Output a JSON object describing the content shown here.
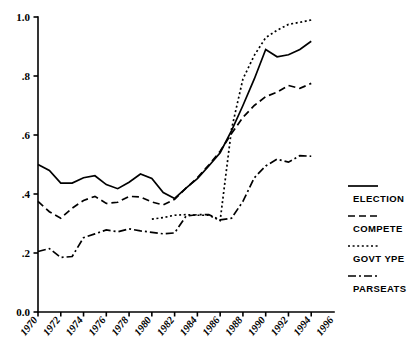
{
  "chart_data": {
    "type": "line",
    "title": "",
    "subtitle": "",
    "xlabel": "",
    "ylabel": "",
    "xlim": [
      1970,
      1996
    ],
    "ylim": [
      0.0,
      1.0
    ],
    "grid": false,
    "legend_position": "right",
    "x": [
      1970,
      1971,
      1972,
      1973,
      1974,
      1975,
      1976,
      1977,
      1978,
      1979,
      1980,
      1981,
      1982,
      1983,
      1984,
      1985,
      1986,
      1987,
      1988,
      1989,
      1990,
      1991,
      1992,
      1993,
      1994
    ],
    "x_tick_labels": [
      "1970",
      "1972",
      "1974",
      "1976",
      "1978",
      "1980",
      "1982",
      "1984",
      "1986",
      "1988",
      "1990",
      "1992",
      "1994",
      "1996"
    ],
    "y_tick_labels": [
      "0.0",
      ".2",
      ".4",
      ".6",
      ".8",
      "1.0"
    ],
    "y_tick_values": [
      0.0,
      0.2,
      0.4,
      0.6,
      0.8,
      1.0
    ],
    "series": [
      {
        "name": "ELECTION",
        "style": "solid",
        "values": [
          0.5,
          0.48,
          0.437,
          0.437,
          0.455,
          0.462,
          0.432,
          0.418,
          0.44,
          0.468,
          0.453,
          0.405,
          0.385,
          0.42,
          0.452,
          0.495,
          0.54,
          0.615,
          0.7,
          0.79,
          0.89,
          0.865,
          0.872,
          0.89,
          0.918
        ]
      },
      {
        "name": "COMPETE",
        "style": "dashed",
        "values": [
          0.375,
          0.34,
          0.318,
          0.352,
          0.378,
          0.392,
          0.368,
          0.372,
          0.392,
          0.39,
          0.373,
          0.363,
          0.382,
          0.42,
          0.455,
          0.498,
          0.545,
          0.605,
          0.66,
          0.7,
          0.73,
          0.745,
          0.768,
          0.758,
          0.775
        ]
      },
      {
        "name": "GOVTYPE",
        "style": "dotted",
        "values": [
          null,
          null,
          null,
          null,
          null,
          null,
          null,
          null,
          null,
          null,
          0.315,
          0.32,
          0.328,
          0.33,
          0.328,
          0.328,
          0.31,
          0.62,
          0.79,
          0.87,
          0.93,
          0.955,
          0.975,
          0.982,
          0.99
        ]
      },
      {
        "name": "PARSEATS",
        "style": "dashdot",
        "values": [
          0.205,
          0.215,
          0.185,
          0.188,
          0.252,
          0.265,
          0.278,
          0.272,
          0.282,
          0.275,
          0.27,
          0.265,
          0.268,
          0.325,
          0.33,
          0.33,
          0.312,
          0.318,
          0.375,
          0.455,
          0.495,
          0.518,
          0.508,
          0.53,
          0.528
        ]
      }
    ]
  },
  "legend": {
    "items": [
      {
        "label": "ELECTION",
        "style": "solid"
      },
      {
        "label": "COMPETE",
        "style": "dashed"
      },
      {
        "label": "GOVT YPE",
        "style": "dotted"
      },
      {
        "label": "PARSEATS",
        "style": "dashdot"
      }
    ]
  }
}
